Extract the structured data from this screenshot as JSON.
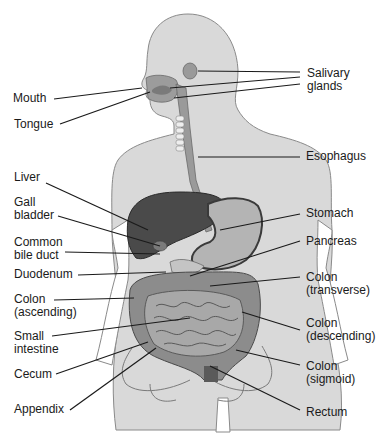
{
  "diagram": {
    "colors": {
      "body": "#d9d9d9",
      "body_outline": "#8a8a8a",
      "organ_dark": "#4a4a4a",
      "organ_mid": "#8c8c8c",
      "organ_light": "#b4b4b4",
      "leader": "#1a1a1a",
      "text": "#1a1a1a"
    },
    "labels_left": [
      {
        "id": "mouth",
        "lines": [
          "Mouth"
        ]
      },
      {
        "id": "tongue",
        "lines": [
          "Tongue"
        ]
      },
      {
        "id": "liver",
        "lines": [
          "Liver"
        ]
      },
      {
        "id": "gall-bladder",
        "lines": [
          "Gall",
          "bladder"
        ]
      },
      {
        "id": "common-bile-duct",
        "lines": [
          "Common",
          "bile duct"
        ]
      },
      {
        "id": "duodenum",
        "lines": [
          "Duodenum"
        ]
      },
      {
        "id": "colon-ascending",
        "lines": [
          "Colon",
          "(ascending)"
        ]
      },
      {
        "id": "small-intestine",
        "lines": [
          "Small",
          "intestine"
        ]
      },
      {
        "id": "cecum",
        "lines": [
          "Cecum"
        ]
      },
      {
        "id": "appendix",
        "lines": [
          "Appendix"
        ]
      }
    ],
    "labels_right": [
      {
        "id": "salivary-glands",
        "lines": [
          "Salivary",
          "glands"
        ]
      },
      {
        "id": "esophagus",
        "lines": [
          "Esophagus"
        ]
      },
      {
        "id": "stomach",
        "lines": [
          "Stomach"
        ]
      },
      {
        "id": "pancreas",
        "lines": [
          "Pancreas"
        ]
      },
      {
        "id": "colon-transverse",
        "lines": [
          "Colon",
          "(transverse)"
        ]
      },
      {
        "id": "colon-descending",
        "lines": [
          "Colon",
          "(descending)"
        ]
      },
      {
        "id": "colon-sigmoid",
        "lines": [
          "Colon",
          "(sigmoid)"
        ]
      },
      {
        "id": "rectum",
        "lines": [
          "Rectum"
        ]
      }
    ]
  }
}
